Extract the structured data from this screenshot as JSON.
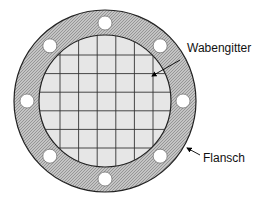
{
  "diagram": {
    "type": "flange-with-honeycomb-grid",
    "labels": {
      "grid": "Wabengitter",
      "flange": "Flansch"
    },
    "bolt_hole_count": 8,
    "grid_line_count": {
      "vertical": 6,
      "horizontal": 6
    },
    "colors": {
      "flange_fill": "#b8b8b8",
      "grid_fill": "#e6e6e6",
      "grid_lines": "#333333",
      "outline": "#222222",
      "holes": "#ffffff"
    }
  }
}
